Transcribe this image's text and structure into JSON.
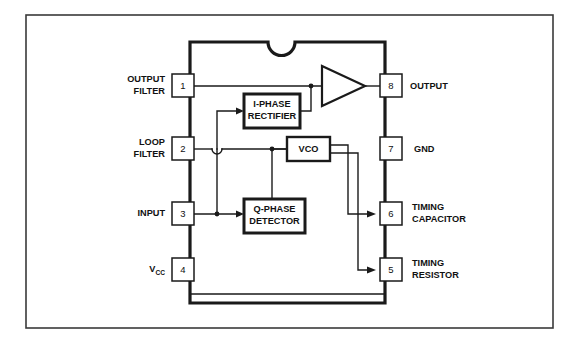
{
  "diagram": {
    "package": "8-pin DIP with top notch",
    "colors": {
      "background": "#ffffff",
      "line": "#1a1a1a",
      "frame": "#3a3a3a",
      "text": "#111111"
    },
    "pins_left": [
      {
        "number": "1",
        "label_line1": "OUTPUT",
        "label_line2": "FILTER"
      },
      {
        "number": "2",
        "label_line1": "LOOP",
        "label_line2": "FILTER"
      },
      {
        "number": "3",
        "label_line1": "INPUT",
        "label_line2": ""
      },
      {
        "number": "4",
        "label_line1": "V",
        "label_sub": "CC",
        "label_line2": ""
      }
    ],
    "pins_right": [
      {
        "number": "8",
        "label_line1": "OUTPUT",
        "label_line2": ""
      },
      {
        "number": "7",
        "label_line1": "GND",
        "label_line2": ""
      },
      {
        "number": "6",
        "label_line1": "TIMING",
        "label_line2": "CAPACITOR"
      },
      {
        "number": "5",
        "label_line1": "TIMING",
        "label_line2": "RESISTOR"
      }
    ],
    "blocks": [
      {
        "id": "i-phase-rectifier",
        "line1": "I-PHASE",
        "line2": "RECTIFIER"
      },
      {
        "id": "vco",
        "line1": "VCO",
        "line2": ""
      },
      {
        "id": "q-phase-detector",
        "line1": "Q-PHASE",
        "line2": "DETECTOR"
      }
    ],
    "amplifier": {
      "id": "output-amplifier",
      "shape": "triangle"
    }
  }
}
